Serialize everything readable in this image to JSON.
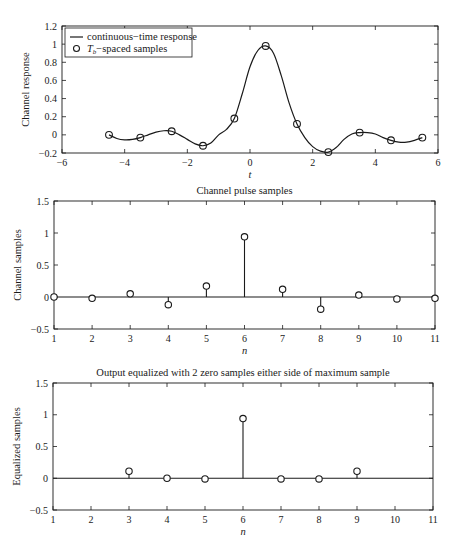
{
  "figure": {
    "width": 459,
    "height": 546,
    "line_color": "#1a1a1a",
    "background": "#ffffff"
  },
  "chart_data": [
    {
      "id": "continuous",
      "type": "line",
      "title": "",
      "xlabel": "t",
      "ylabel": "Channel response",
      "xlim": [
        -6,
        6
      ],
      "ylim": [
        -0.2,
        1.2
      ],
      "xticks": [
        -6,
        -4,
        -2,
        0,
        2,
        4,
        6
      ],
      "yticks": [
        -0.2,
        0,
        0.2,
        0.4,
        0.6,
        0.8,
        1,
        1.2
      ],
      "ytick_labels": [
        "-0.2",
        "0",
        "0.2",
        "0.4",
        "0.6",
        "0.8",
        "1",
        "1.2"
      ],
      "grid": false,
      "legend": {
        "position": "upper-left",
        "entries": [
          {
            "label": "continuous−time response",
            "marker": "line"
          },
          {
            "label_main": "T",
            "label_sub": "b",
            "label_rest": "−spaced samples",
            "marker": "circle"
          }
        ]
      },
      "box": {
        "left": 62,
        "right": 438,
        "top": 26,
        "bottom": 153
      },
      "series": [
        {
          "name": "continuous-time response",
          "style": "line",
          "x": [
            -4.5,
            -4.25,
            -4.0,
            -3.75,
            -3.5,
            -3.25,
            -3.0,
            -2.75,
            -2.5,
            -2.25,
            -2.0,
            -1.75,
            -1.5,
            -1.25,
            -1.0,
            -0.75,
            -0.5,
            -0.25,
            0.0,
            0.25,
            0.5,
            0.75,
            1.0,
            1.25,
            1.5,
            1.75,
            2.0,
            2.25,
            2.5,
            2.75,
            3.0,
            3.25,
            3.5,
            3.75,
            4.0,
            4.25,
            4.5,
            4.75,
            5.0,
            5.25,
            5.5
          ],
          "y": [
            0.0,
            -0.04,
            -0.055,
            -0.05,
            -0.03,
            0.0,
            0.03,
            0.045,
            0.04,
            0.0,
            -0.05,
            -0.1,
            -0.12,
            -0.09,
            0.0,
            0.06,
            0.18,
            0.45,
            0.75,
            0.93,
            0.98,
            0.9,
            0.65,
            0.35,
            0.12,
            -0.03,
            -0.13,
            -0.18,
            -0.19,
            -0.14,
            -0.05,
            0.01,
            0.025,
            0.025,
            0.01,
            -0.03,
            -0.06,
            -0.08,
            -0.08,
            -0.06,
            -0.03
          ]
        },
        {
          "name": "Tb-spaced samples",
          "style": "circle",
          "x": [
            -4.5,
            -3.5,
            -2.5,
            -1.5,
            -0.5,
            0.5,
            1.5,
            2.5,
            3.5,
            4.5,
            5.5
          ],
          "y": [
            0.0,
            -0.03,
            0.04,
            -0.12,
            0.18,
            0.98,
            0.12,
            -0.19,
            0.025,
            -0.06,
            -0.03
          ]
        }
      ]
    },
    {
      "id": "channel_samples",
      "type": "stem",
      "title": "Channel pulse samples",
      "xlabel": "n",
      "ylabel": "Channel samples",
      "xlim": [
        1,
        11
      ],
      "ylim": [
        -0.5,
        1.5
      ],
      "xticks": [
        1,
        2,
        3,
        4,
        5,
        6,
        7,
        8,
        9,
        10,
        11
      ],
      "yticks": [
        -0.5,
        0,
        0.5,
        1,
        1.5
      ],
      "ytick_labels": [
        "−0.5",
        "0",
        "0.5",
        "1",
        "1.5"
      ],
      "grid": false,
      "box": {
        "left": 54,
        "right": 435,
        "top": 201,
        "bottom": 329
      },
      "categories": [
        1,
        2,
        3,
        4,
        5,
        6,
        7,
        8,
        9,
        10,
        11
      ],
      "values": [
        0.0,
        -0.02,
        0.05,
        -0.12,
        0.17,
        0.94,
        0.12,
        -0.19,
        0.03,
        -0.03,
        -0.02
      ]
    },
    {
      "id": "equalized_samples",
      "type": "stem",
      "title": "Output equalized with 2 zero samples either side of maximum sample",
      "xlabel": "n",
      "ylabel": "Equalized samples",
      "xlim": [
        1,
        11
      ],
      "ylim": [
        -0.5,
        1.5
      ],
      "xticks": [
        1,
        2,
        3,
        4,
        5,
        6,
        7,
        8,
        9,
        10,
        11
      ],
      "yticks": [
        -0.5,
        0,
        0.5,
        1,
        1.5
      ],
      "ytick_labels": [
        "−0.5",
        "0",
        "0.5",
        "1",
        "1.5"
      ],
      "grid": false,
      "box": {
        "left": 53,
        "right": 433,
        "top": 383,
        "bottom": 510
      },
      "categories": [
        3,
        4,
        5,
        6,
        7,
        8,
        9
      ],
      "values": [
        0.11,
        0.0,
        -0.01,
        0.94,
        -0.01,
        -0.01,
        0.11
      ]
    }
  ]
}
